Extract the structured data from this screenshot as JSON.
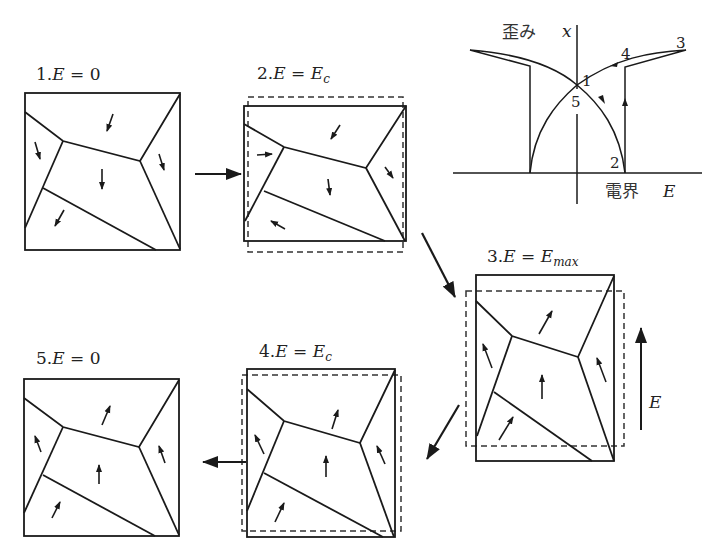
{
  "panels": [
    {
      "id": 1,
      "label_prefix": "1.",
      "var": "E",
      "eq": " = ",
      "value": "0",
      "sub": ""
    },
    {
      "id": 2,
      "label_prefix": "2.",
      "var": "E",
      "eq": " = ",
      "value": "E",
      "sub": "c"
    },
    {
      "id": 3,
      "label_prefix": "3.",
      "var": "E",
      "eq": " = ",
      "value": "E",
      "sub": "max"
    },
    {
      "id": 4,
      "label_prefix": "4.",
      "var": "E",
      "eq": " = ",
      "value": "E",
      "sub": "c"
    },
    {
      "id": 5,
      "label_prefix": "5.",
      "var": "E",
      "eq": " = ",
      "value": "0",
      "sub": ""
    }
  ],
  "field_arrow": {
    "label": "E"
  },
  "butterfly": {
    "y_label_jp": "歪み",
    "y_label_var": "x",
    "x_label_jp": "電界",
    "x_label_var": "E",
    "points": [
      "1",
      "2",
      "3",
      "4",
      "5"
    ]
  },
  "colors": {
    "line": "#1a1a1a",
    "background": "#ffffff"
  }
}
